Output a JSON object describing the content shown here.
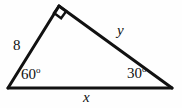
{
  "figure": {
    "type": "geometry-diagram",
    "shape": "right-triangle",
    "background_color": "#fefefe",
    "stroke_color": "#111111",
    "text_color": "#111111"
  },
  "labels": {
    "side_left": "8",
    "side_right": "y",
    "side_bottom": "x",
    "angle_left_value": "60",
    "angle_right_value": "30",
    "degree_symbol": "o"
  },
  "markers": {
    "right_angle": "right-angle-square"
  },
  "geometry": {
    "vertex_left": {
      "x": 8,
      "y": 88
    },
    "vertex_apex": {
      "x": 59,
      "y": 6
    },
    "vertex_right": {
      "x": 172,
      "y": 88
    }
  }
}
